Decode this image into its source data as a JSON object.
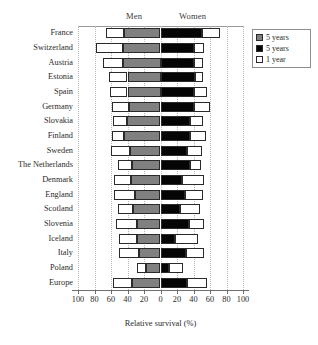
{
  "headers": {
    "men": "Men",
    "women": "Women"
  },
  "legend": {
    "items": [
      {
        "label": "5 years",
        "color": "#808080",
        "swatch": "gray"
      },
      {
        "label": "5 years",
        "color": "#050505",
        "swatch": "black"
      },
      {
        "label": "1 year",
        "color": "#ffffff",
        "swatch": "white"
      }
    ]
  },
  "chart_data": {
    "type": "bar",
    "subtype": "diverging-stacked-bar",
    "title": "",
    "xlabel": "Relative survival (%)",
    "ylabel": "",
    "xlim": [
      -100,
      100
    ],
    "xticks": [
      -100,
      -80,
      -60,
      -40,
      -20,
      0,
      20,
      40,
      60,
      80,
      100
    ],
    "xticklabels": [
      "100",
      "80",
      "60",
      "40",
      "20",
      "0",
      "20",
      "40",
      "60",
      "80",
      "100"
    ],
    "grid": "vertical-dotted",
    "legend_position": "top-right-outside",
    "categories": [
      "France",
      "Switzerland",
      "Austria",
      "Estonia",
      "Spain",
      "Germany",
      "Slovakia",
      "Finland",
      "Sweden",
      "The Netherlands",
      "Denmark",
      "England",
      "Scotland",
      "Slovenia",
      "Iceland",
      "Italy",
      "Poland",
      "Europe"
    ],
    "series": [
      {
        "name": "Men 1 year",
        "side": "left",
        "color": "#ffffff",
        "values": [
          66,
          78,
          70,
          63,
          61,
          59,
          57,
          59,
          60,
          52,
          56,
          56,
          52,
          54,
          50,
          50,
          28,
          57
        ]
      },
      {
        "name": "Men 5 years",
        "side": "left",
        "color": "#808080",
        "values": [
          44,
          46,
          45,
          40,
          40,
          38,
          41,
          44,
          37,
          34,
          36,
          31,
          33,
          29,
          28,
          26,
          18,
          34
        ]
      },
      {
        "name": "Women 5 years",
        "side": "right",
        "color": "#050505",
        "values": [
          50,
          41,
          41,
          42,
          40,
          41,
          36,
          36,
          32,
          36,
          26,
          30,
          24,
          34,
          18,
          31,
          10,
          32
        ]
      },
      {
        "name": "Women 1 year",
        "side": "right",
        "color": "#ffffff",
        "values": [
          72,
          53,
          51,
          51,
          56,
          60,
          51,
          55,
          50,
          49,
          53,
          52,
          48,
          53,
          45,
          53,
          27,
          56
        ]
      }
    ]
  }
}
